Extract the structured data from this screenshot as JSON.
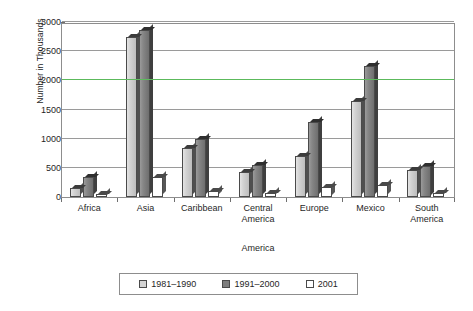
{
  "chart_data": {
    "type": "bar",
    "title": "",
    "xlabel": "America",
    "ylabel": "Number in Thousands",
    "ylim": [
      0,
      3000
    ],
    "yticks": [
      0,
      500,
      1000,
      1500,
      2000,
      2500,
      3000
    ],
    "ytick_labels": [
      "0",
      "500",
      "1000",
      "1500",
      "2000",
      "2500",
      "3000"
    ],
    "grid": true,
    "grid_highlight_value": 2000,
    "grid_highlight_color": "#5cba5c",
    "legend_position": "bottom",
    "categories": [
      "Africa",
      "Asia",
      "Caribbean",
      "Central America",
      "Europe",
      "Mexico",
      "South America"
    ],
    "category_lines": [
      [
        "Africa"
      ],
      [
        "Asia"
      ],
      [
        "Caribbean"
      ],
      [
        "Central",
        "America"
      ],
      [
        "Europe"
      ],
      [
        "Mexico"
      ],
      [
        "South",
        "America"
      ]
    ],
    "series": [
      {
        "name": "1981–1990",
        "color": "#d4d4d4",
        "values": [
          160,
          2750,
          840,
          425,
          700,
          1650,
          460
        ]
      },
      {
        "name": "1991–2000",
        "color": "#7e7e7e",
        "values": [
          350,
          2870,
          990,
          555,
          1290,
          2250,
          540
        ]
      },
      {
        "name": "2001",
        "color": "#ffffff",
        "values": [
          60,
          350,
          110,
          65,
          180,
          210,
          70
        ]
      }
    ]
  },
  "legend": {
    "items": [
      {
        "label": "1981–1990",
        "swatch": "light-gray"
      },
      {
        "label": "1991–2000",
        "swatch": "dark-gray"
      },
      {
        "label": "2001",
        "swatch": "white"
      }
    ]
  }
}
